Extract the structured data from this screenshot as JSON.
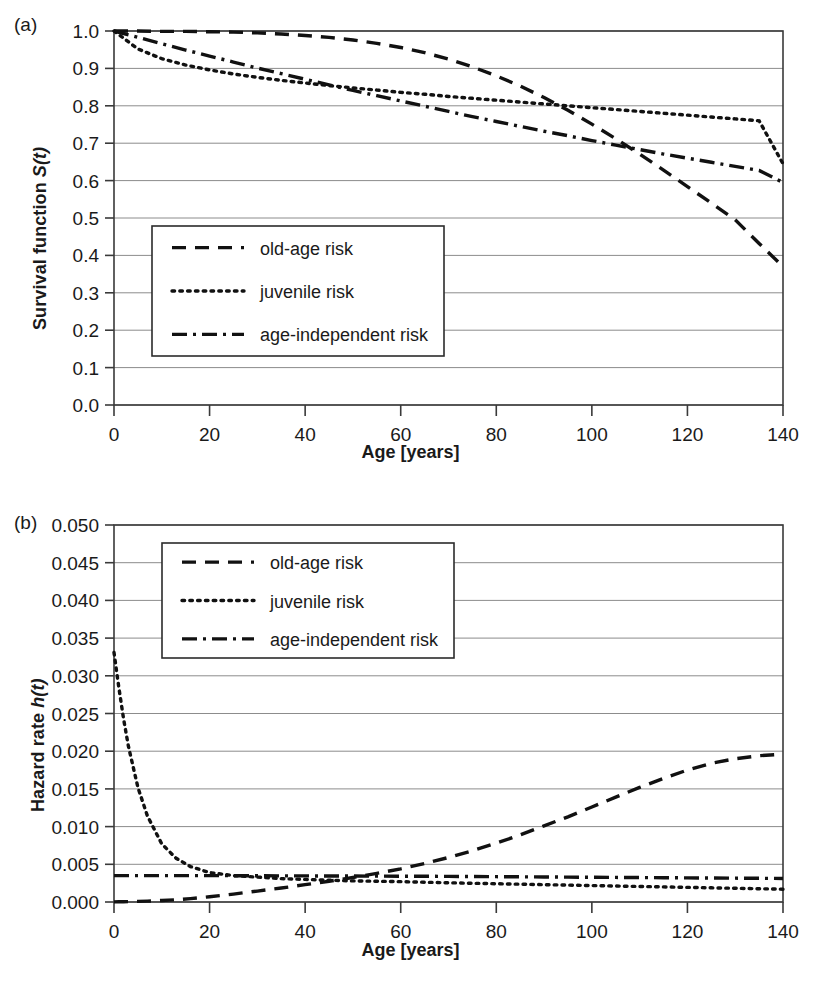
{
  "figure": {
    "panel_a_letter": "(a)",
    "panel_b_letter": "(b)",
    "xlabel": "Age [years]"
  },
  "series_labels": {
    "old": "old-age risk",
    "juvenile": "juvenile risk",
    "independent": "age-independent risk"
  },
  "chart_data": [
    {
      "type": "line",
      "panel": "(a)",
      "title": "",
      "xlabel": "Age [years]",
      "ylabel": "Survival function S(t)",
      "ylabel_plain": "Survival function ",
      "ylabel_italic": "S(t)",
      "xlim": [
        0,
        140
      ],
      "ylim": [
        0,
        1
      ],
      "xticks": [
        0,
        20,
        40,
        60,
        80,
        100,
        120,
        140
      ],
      "yticks": [
        "0.0",
        "0.1",
        "0.2",
        "0.3",
        "0.4",
        "0.5",
        "0.6",
        "0.7",
        "0.8",
        "0.9",
        "1.0"
      ],
      "grid": true,
      "legend_position": "center-left",
      "x": [
        0,
        5,
        10,
        15,
        20,
        25,
        30,
        35,
        40,
        45,
        50,
        55,
        60,
        65,
        70,
        75,
        80,
        85,
        90,
        95,
        100,
        105,
        110,
        115,
        120,
        125,
        130,
        135,
        140
      ],
      "series": [
        {
          "name": "old-age risk",
          "style": "dashed",
          "values": [
            1.0,
            1.0,
            0.999,
            0.999,
            0.998,
            0.997,
            0.995,
            0.992,
            0.988,
            0.983,
            0.976,
            0.967,
            0.956,
            0.942,
            0.925,
            0.904,
            0.88,
            0.853,
            0.822,
            0.788,
            0.751,
            0.712,
            0.671,
            0.628,
            0.584,
            0.54,
            0.495,
            0.432,
            0.37
          ]
        },
        {
          "name": "juvenile risk",
          "style": "dotted",
          "values": [
            1.0,
            0.952,
            0.926,
            0.909,
            0.896,
            0.885,
            0.876,
            0.868,
            0.861,
            0.854,
            0.848,
            0.842,
            0.836,
            0.831,
            0.825,
            0.82,
            0.815,
            0.81,
            0.805,
            0.8,
            0.795,
            0.79,
            0.785,
            0.78,
            0.775,
            0.77,
            0.765,
            0.76,
            0.645
          ]
        },
        {
          "name": "age-independent risk",
          "style": "dashdot",
          "values": [
            1.0,
            0.983,
            0.966,
            0.949,
            0.933,
            0.917,
            0.901,
            0.886,
            0.871,
            0.856,
            0.841,
            0.827,
            0.813,
            0.799,
            0.785,
            0.771,
            0.758,
            0.745,
            0.732,
            0.72,
            0.707,
            0.695,
            0.683,
            0.671,
            0.66,
            0.649,
            0.638,
            0.627,
            0.595
          ]
        }
      ]
    },
    {
      "type": "line",
      "panel": "(b)",
      "title": "",
      "xlabel": "Age [years]",
      "ylabel": "Hazard rate h(t)",
      "ylabel_plain": "Hazard rate ",
      "ylabel_italic": "h(t)",
      "xlim": [
        0,
        140
      ],
      "ylim": [
        0,
        0.05
      ],
      "xticks": [
        0,
        20,
        40,
        60,
        80,
        100,
        120,
        140
      ],
      "yticks": [
        "0.000",
        "0.005",
        "0.010",
        "0.015",
        "0.020",
        "0.025",
        "0.030",
        "0.035",
        "0.040",
        "0.045",
        "0.050"
      ],
      "grid": true,
      "legend_position": "upper-left",
      "x": [
        0,
        1,
        2,
        3,
        5,
        7,
        10,
        13,
        16,
        20,
        25,
        30,
        35,
        40,
        45,
        50,
        55,
        60,
        65,
        70,
        75,
        80,
        85,
        90,
        95,
        100,
        105,
        110,
        115,
        120,
        125,
        130,
        135,
        140
      ],
      "series": [
        {
          "name": "old-age risk",
          "style": "dashed",
          "values": [
            2e-05,
            3e-05,
            4e-05,
            5e-05,
            8e-05,
            0.00012,
            0.0002,
            0.0003,
            0.00045,
            0.0007,
            0.00105,
            0.00145,
            0.00185,
            0.0023,
            0.00275,
            0.00325,
            0.0038,
            0.0044,
            0.0051,
            0.0059,
            0.0068,
            0.0078,
            0.0089,
            0.0101,
            0.0113,
            0.0126,
            0.0139,
            0.0152,
            0.0164,
            0.0175,
            0.0184,
            0.019,
            0.0194,
            0.0196
          ]
        },
        {
          "name": "juvenile risk",
          "style": "dotted",
          "values": [
            0.0331,
            0.0285,
            0.0243,
            0.0207,
            0.0152,
            0.0114,
            0.0077,
            0.0058,
            0.0047,
            0.0039,
            0.0035,
            0.0033,
            0.0031,
            0.003,
            0.0029,
            0.0028,
            0.00275,
            0.0027,
            0.00262,
            0.00255,
            0.00248,
            0.00242,
            0.00236,
            0.0023,
            0.00224,
            0.00218,
            0.00212,
            0.00206,
            0.002,
            0.00194,
            0.00188,
            0.00182,
            0.00176,
            0.0017
          ]
        },
        {
          "name": "age-independent risk",
          "style": "dashdot",
          "values": [
            0.0035,
            0.0035,
            0.0035,
            0.0035,
            0.0035,
            0.0035,
            0.0035,
            0.0035,
            0.0035,
            0.0035,
            0.00349,
            0.00348,
            0.00347,
            0.00346,
            0.00345,
            0.00344,
            0.00343,
            0.00342,
            0.00341,
            0.0034,
            0.00338,
            0.00336,
            0.00334,
            0.00332,
            0.0033,
            0.00328,
            0.00326,
            0.00324,
            0.00322,
            0.0032,
            0.00318,
            0.00316,
            0.00314,
            0.00312
          ]
        }
      ]
    }
  ]
}
